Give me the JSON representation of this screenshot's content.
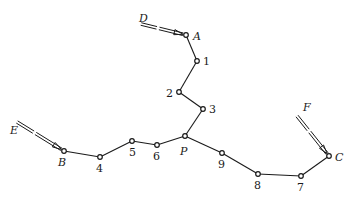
{
  "diagram": {
    "type": "network-path",
    "colors": {
      "stroke": "#1a1a1a",
      "background": "#ffffff"
    },
    "nodes": [
      {
        "id": "A",
        "label": "A",
        "x": 186,
        "y": 35,
        "lx": 193,
        "ly": 40,
        "italic": true
      },
      {
        "id": "1",
        "label": "1",
        "x": 197,
        "y": 61,
        "lx": 203,
        "ly": 65,
        "italic": false
      },
      {
        "id": "2",
        "label": "2",
        "x": 179,
        "y": 92,
        "lx": 166,
        "ly": 97,
        "italic": false
      },
      {
        "id": "3",
        "label": "3",
        "x": 203,
        "y": 109,
        "lx": 209,
        "ly": 113,
        "italic": false
      },
      {
        "id": "P",
        "label": "P",
        "x": 185,
        "y": 136,
        "lx": 180,
        "ly": 155,
        "italic": true
      },
      {
        "id": "6",
        "label": "6",
        "x": 157,
        "y": 145,
        "lx": 153,
        "ly": 160,
        "italic": false
      },
      {
        "id": "5",
        "label": "5",
        "x": 132,
        "y": 141,
        "lx": 129,
        "ly": 156,
        "italic": false
      },
      {
        "id": "4",
        "label": "4",
        "x": 100,
        "y": 157,
        "lx": 96,
        "ly": 172,
        "italic": false
      },
      {
        "id": "B",
        "label": "B",
        "x": 64,
        "y": 151,
        "lx": 58,
        "ly": 166,
        "italic": true
      },
      {
        "id": "9",
        "label": "9",
        "x": 222,
        "y": 153,
        "lx": 218,
        "ly": 168,
        "italic": false
      },
      {
        "id": "8",
        "label": "8",
        "x": 258,
        "y": 174,
        "lx": 254,
        "ly": 189,
        "italic": false
      },
      {
        "id": "7",
        "label": "7",
        "x": 301,
        "y": 176,
        "lx": 297,
        "ly": 191,
        "italic": false
      },
      {
        "id": "C",
        "label": "C",
        "x": 329,
        "y": 156,
        "lx": 335,
        "ly": 161,
        "italic": true
      }
    ],
    "edges": [
      [
        "A",
        "1"
      ],
      [
        "1",
        "2"
      ],
      [
        "2",
        "3"
      ],
      [
        "3",
        "P"
      ],
      [
        "P",
        "6"
      ],
      [
        "6",
        "5"
      ],
      [
        "5",
        "4"
      ],
      [
        "4",
        "B"
      ],
      [
        "P",
        "9"
      ],
      [
        "9",
        "8"
      ],
      [
        "8",
        "7"
      ],
      [
        "7",
        "C"
      ]
    ],
    "feeders": [
      {
        "id": "D",
        "label": "D",
        "from": [
          141,
          24
        ],
        "to": [
          186,
          35
        ],
        "lx": 139,
        "ly": 22
      },
      {
        "id": "E",
        "label": "E",
        "from": [
          17,
          122
        ],
        "to": [
          64,
          151
        ],
        "lx": 10,
        "ly": 134
      },
      {
        "id": "F",
        "label": "F",
        "from": [
          297,
          116
        ],
        "to": [
          329,
          156
        ],
        "lx": 303,
        "ly": 111
      }
    ]
  }
}
